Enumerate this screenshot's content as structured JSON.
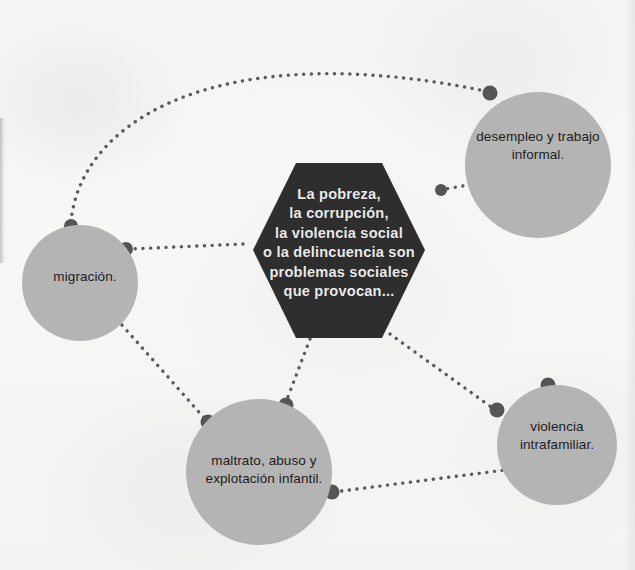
{
  "diagram": {
    "type": "concept-map",
    "title_node": {
      "name": "central-hexagon",
      "shape": "hexagon",
      "color": "#2e2e2e",
      "text_color": "#ececec",
      "text": "La pobreza,\nla corrupción,\nla violencia social\no la delincuencia son\nproblemas sociales\nque provocan..."
    },
    "node_color": "#b4b4b4",
    "connector_color": "#5a5a5a",
    "background_color": "#f5f5f4",
    "nodes": [
      {
        "id": "migracion",
        "label": "migración.",
        "cx": 80,
        "cy": 283,
        "r": 58
      },
      {
        "id": "desempleo",
        "label": "desempleo y trabajo\ninformal.",
        "cx": 538,
        "cy": 165,
        "r": 73
      },
      {
        "id": "violencia",
        "label": "violencia\nintrafamiliar.",
        "cx": 557,
        "cy": 445,
        "r": 60
      },
      {
        "id": "maltrato",
        "label": "maltrato, abuso y\nexplotación infantil.",
        "cx": 259,
        "cy": 472,
        "r": 73
      }
    ],
    "connections": [
      {
        "from": "hexagon",
        "to": "desempleo",
        "style": "dotted"
      },
      {
        "from": "hexagon",
        "to": "maltrato",
        "style": "dotted"
      },
      {
        "from": "hexagon",
        "to": "violencia",
        "style": "dotted"
      },
      {
        "from": "hexagon",
        "to": "migracion",
        "style": "dotted"
      },
      {
        "from": "migracion",
        "to": "desempleo",
        "style": "dotted-arc"
      },
      {
        "from": "migracion",
        "to": "maltrato",
        "style": "dotted"
      },
      {
        "from": "maltrato",
        "to": "violencia",
        "style": "dotted"
      }
    ]
  }
}
